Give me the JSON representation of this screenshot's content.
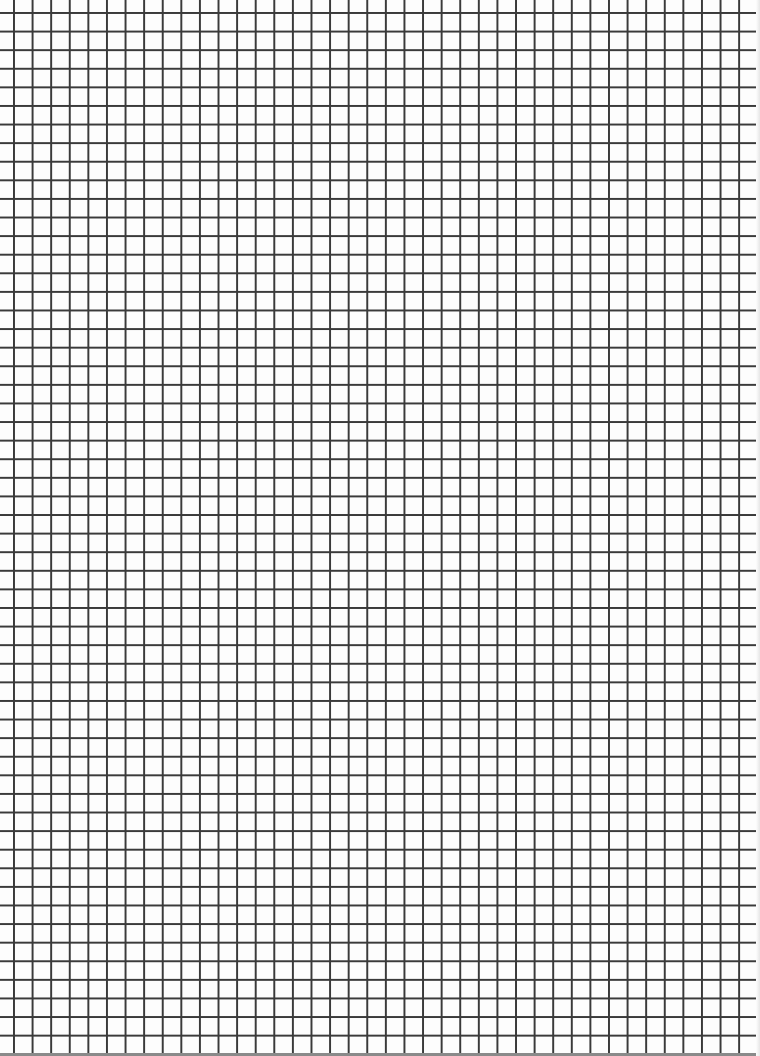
{
  "page": {
    "type": "grid-paper",
    "grid": {
      "columns": 40,
      "rows": 56,
      "cell_size_px": 18.6,
      "line_color": "#3a3a3a",
      "background_color": "#fdfdfd"
    }
  }
}
